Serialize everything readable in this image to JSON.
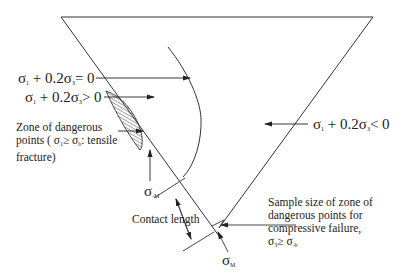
{
  "diagram": {
    "type": "stress-zone-diagram",
    "labels": {
      "eq_equal": {
        "sig": "σ",
        "s1": "1",
        "mid": " + 0.2σ",
        "s3": "3",
        "tail": "= 0"
      },
      "eq_greater": {
        "sig": "σ",
        "s1": "1",
        "mid": " + 0.2σ",
        "s3": "3",
        "tail": "> 0"
      },
      "eq_less": {
        "sig": "σ",
        "s1": "1",
        "mid": " + 0.2σ",
        "s3": "3",
        "tail": "< 0"
      },
      "tensile_zone": {
        "line1": "Zone of dangerous",
        "line2_pre": "points (  σ",
        "line2_s1": "1",
        "line2_mid": "≥ σ",
        "line2_sb": "b",
        "line2_post": ": tensile",
        "line3": "fracture)"
      },
      "sigma_neg_M": {
        "sig": "σ",
        "sub": "-M"
      },
      "sigma_M": {
        "sig": "σ",
        "sub": "M"
      },
      "contact_length": "Contact length",
      "compressive_zone": {
        "line1": "Sample size of zone of",
        "line2": "dangerous points for",
        "line3": "compressive failure,",
        "line4_pre": "σ",
        "line4_s3": "3",
        "line4_mid": "≥ σ",
        "line4_sb": "-b"
      }
    },
    "colors": {
      "line": "#333333",
      "hatch": "#333333",
      "background": "#ffffff"
    }
  }
}
